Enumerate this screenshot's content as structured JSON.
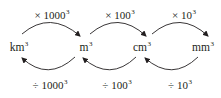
{
  "units": [
    {
      "base": "km",
      "exp": "3",
      "x": 19
    },
    {
      "base": "m",
      "exp": "3",
      "x": 86
    },
    {
      "base": "cm",
      "exp": "3",
      "x": 142
    },
    {
      "base": "mm",
      "exp": "3",
      "x": 203
    }
  ],
  "forward": [
    {
      "op": "×",
      "base": "1000",
      "exp": "3",
      "x": 52
    },
    {
      "op": "×",
      "base": "100",
      "exp": "3",
      "x": 120
    },
    {
      "op": "×",
      "base": "10",
      "exp": "3",
      "x": 184
    }
  ],
  "reverse": [
    {
      "op": "÷",
      "base": "1000",
      "exp": "3",
      "x": 50
    },
    {
      "op": "÷",
      "base": "100",
      "exp": "3",
      "x": 117
    },
    {
      "op": "÷",
      "base": "10",
      "exp": "3",
      "x": 180
    }
  ],
  "colors": {
    "stroke": "#231f20",
    "text": "#231f20"
  }
}
